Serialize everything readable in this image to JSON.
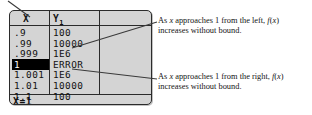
{
  "figure": {
    "type": "graphing-calculator-table-with-annotations",
    "device_label": "graphing calculator screen"
  },
  "calculator": {
    "table": {
      "headers": {
        "x": "X",
        "y1_base": "Y",
        "y1_sub": "1",
        "blank": ""
      },
      "rows": [
        {
          "x": ".9",
          "y1": "100",
          "selected": false
        },
        {
          "x": ".99",
          "y1": "10000",
          "selected": false
        },
        {
          "x": ".999",
          "y1": "1E6",
          "selected": false
        },
        {
          "x": "1",
          "y1": "ERROR",
          "selected": true
        },
        {
          "x": "1.001",
          "y1": "1E6",
          "selected": false
        },
        {
          "x": "1.01",
          "y1": "10000",
          "selected": false
        },
        {
          "x": "1.1",
          "y1": "100",
          "selected": false
        }
      ]
    },
    "status_line": "X=1"
  },
  "annotations": [
    {
      "id": "left-approach",
      "line1_pre": "As ",
      "line1_var": "x",
      "line1_mid": " approaches 1 from the left, ",
      "line1_fn": "f",
      "line1_paren_open": "(",
      "line1_fnvar": "x",
      "line1_paren_close": ")",
      "line2": "increases without bound."
    },
    {
      "id": "right-approach",
      "line1_pre": "As ",
      "line1_var": "x",
      "line1_mid": " approaches 1 from the right, ",
      "line1_fn": "f",
      "line1_paren_open": "(",
      "line1_fnvar": "x",
      "line1_paren_close": ")",
      "line2": "increases without bound."
    }
  ],
  "colors": {
    "screen_background": "#d4d4d4",
    "screen_border": "#2b2b2b",
    "text": "#111111",
    "selected_background": "#000000",
    "selected_text": "#ffffff",
    "leader_line": "#3a3a3a",
    "page_background": "#ffffff"
  }
}
